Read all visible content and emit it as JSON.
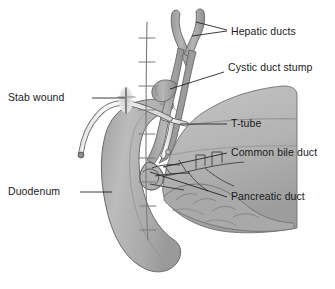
{
  "figure": {
    "kind": "anatomical-illustration",
    "background_color": "#ffffff",
    "text_color": "#1a1a1a"
  },
  "palette": {
    "duct_fill": "#a9a9a9",
    "duct_stroke": "#6e6e6e",
    "duodenum_fill": "#b4b4b4",
    "duodenum_stroke": "#6a6a6a",
    "pancreas_fill": "#bdbdbd",
    "pancreas_stroke": "#6a6a6a",
    "pancreas_shadow": "#a6a6a6",
    "tube_fill": "#f2f2f2",
    "tube_stroke": "#5a5a5a",
    "suture_line": "#7a7a7a",
    "leader_line": "#1a1a1a"
  },
  "labels": [
    {
      "id": "hepatic-ducts",
      "text": "Hepatic ducts",
      "side": "right",
      "x": 231,
      "y": 26,
      "leader": "M 227 30 L 196 22 M 227 31 L 192 36"
    },
    {
      "id": "cystic-duct-stump",
      "text": "Cystic duct stump",
      "side": "right",
      "x": 228,
      "y": 68,
      "leader": "M 224 72 L 170 89"
    },
    {
      "id": "t-tube",
      "text": "T-tube",
      "side": "right",
      "x": 231,
      "y": 120,
      "leader": "M 227 124 L 180 124"
    },
    {
      "id": "common-bile-duct",
      "text": "Common bile duct",
      "side": "right",
      "x": 231,
      "y": 149,
      "leader": "M 227 153 L 163 167"
    },
    {
      "id": "pancreatic-duct",
      "text": "Pancreatic duct",
      "side": "right",
      "x": 231,
      "y": 193,
      "leader": "M 227 197 L 150 172"
    },
    {
      "id": "stab-wound",
      "text": "Stab wound",
      "side": "left",
      "x": 88,
      "y": 94,
      "leader": "M 92 98 L 125 98"
    },
    {
      "id": "duodenum",
      "text": "Duodenum",
      "side": "left",
      "x": 76,
      "y": 188,
      "leader": "M 80 192 L 112 192"
    }
  ],
  "structures": [
    {
      "id": "hepatic-ducts",
      "name": "Hepatic ducts",
      "shape": "Y-shaped bifurcating tube at top"
    },
    {
      "id": "cystic-duct-stump",
      "name": "Cystic duct stump",
      "shape": "short blind-ending hook on left of bile duct"
    },
    {
      "id": "common-bile-duct",
      "name": "Common bile duct",
      "shape": "vertical duct descending to duodenum"
    },
    {
      "id": "t-tube",
      "name": "T-tube",
      "shape": "white tube with limb inside duct exiting through abdominal wall"
    },
    {
      "id": "duodenum",
      "name": "Duodenum",
      "shape": "C-shaped loop on the left"
    },
    {
      "id": "pancreas",
      "name": "Pancreas",
      "shape": "lobulated gland to the right"
    },
    {
      "id": "pancreatic-duct",
      "name": "Pancreatic duct",
      "shape": "branching duct within pancreas"
    },
    {
      "id": "stab-wound",
      "name": "Stab wound",
      "shape": "cross-marked incision in abdominal wall"
    },
    {
      "id": "suture-line",
      "name": "Suture line",
      "shape": "vertical midline incision with transverse stitch ticks"
    }
  ],
  "suture_ticks": [
    38,
    62,
    86,
    110,
    134,
    158,
    182,
    206,
    230
  ]
}
